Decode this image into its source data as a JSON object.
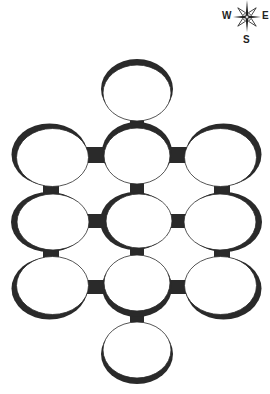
{
  "compass": {
    "labels": {
      "west": "W",
      "east": "E",
      "south": "S"
    }
  },
  "diagram": {
    "type": "dungeon-room-map",
    "wall_color": "#2a2a2a",
    "room_fill": "#ffffff",
    "rooms": [
      {
        "id": "top",
        "cx": 137,
        "cy": 91,
        "rx": 34,
        "ry": 28,
        "shade": "top"
      },
      {
        "id": "r1-left",
        "cx": 51,
        "cy": 156,
        "rx": 36,
        "ry": 29,
        "shade": "left-top"
      },
      {
        "id": "r1-center",
        "cx": 137,
        "cy": 154,
        "rx": 33,
        "ry": 28,
        "shade": "top"
      },
      {
        "id": "r1-right",
        "cx": 222,
        "cy": 156,
        "rx": 36,
        "ry": 29,
        "shade": "right-top"
      },
      {
        "id": "r2-left",
        "cx": 51,
        "cy": 222,
        "rx": 36,
        "ry": 28,
        "shade": "left"
      },
      {
        "id": "r2-center",
        "cx": 137,
        "cy": 221,
        "rx": 33,
        "ry": 27,
        "shade": "left"
      },
      {
        "id": "r2-right",
        "cx": 222,
        "cy": 222,
        "rx": 36,
        "ry": 28,
        "shade": "right"
      },
      {
        "id": "r3-left",
        "cx": 51,
        "cy": 287,
        "rx": 36,
        "ry": 29,
        "shade": "left-bottom"
      },
      {
        "id": "r3-center",
        "cx": 137,
        "cy": 285,
        "rx": 33,
        "ry": 28,
        "shade": "bottom"
      },
      {
        "id": "r3-right",
        "cx": 222,
        "cy": 287,
        "rx": 36,
        "ry": 29,
        "shade": "right-bottom"
      },
      {
        "id": "bottom",
        "cx": 137,
        "cy": 352,
        "rx": 34,
        "ry": 28,
        "shade": "bottom"
      }
    ],
    "corridors": [
      {
        "x": 130,
        "y": 117,
        "w": 14,
        "h": 14
      },
      {
        "x": 85,
        "y": 147,
        "w": 20,
        "h": 16
      },
      {
        "x": 168,
        "y": 147,
        "w": 20,
        "h": 16
      },
      {
        "x": 43,
        "y": 183,
        "w": 16,
        "h": 13
      },
      {
        "x": 130,
        "y": 181,
        "w": 14,
        "h": 14
      },
      {
        "x": 214,
        "y": 183,
        "w": 16,
        "h": 13
      },
      {
        "x": 85,
        "y": 214,
        "w": 20,
        "h": 14
      },
      {
        "x": 168,
        "y": 214,
        "w": 20,
        "h": 14
      },
      {
        "x": 43,
        "y": 248,
        "w": 16,
        "h": 13
      },
      {
        "x": 130,
        "y": 246,
        "w": 14,
        "h": 14
      },
      {
        "x": 214,
        "y": 248,
        "w": 16,
        "h": 13
      },
      {
        "x": 85,
        "y": 280,
        "w": 20,
        "h": 14
      },
      {
        "x": 168,
        "y": 280,
        "w": 20,
        "h": 14
      },
      {
        "x": 130,
        "y": 311,
        "w": 14,
        "h": 14
      }
    ]
  }
}
